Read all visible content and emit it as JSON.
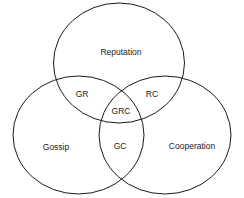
{
  "diagram": {
    "type": "venn",
    "sets": [
      {
        "id": "reputation",
        "label": "Reputation"
      },
      {
        "id": "gossip",
        "label": "Gossip"
      },
      {
        "id": "cooperation",
        "label": "Cooperation"
      }
    ],
    "intersections": {
      "gr": "GR",
      "rc": "RC",
      "gc": "GC",
      "grc": "GRC"
    },
    "colors": {
      "stroke": "#1a1a1a",
      "text": "#222222",
      "background": "#ffffff"
    }
  }
}
